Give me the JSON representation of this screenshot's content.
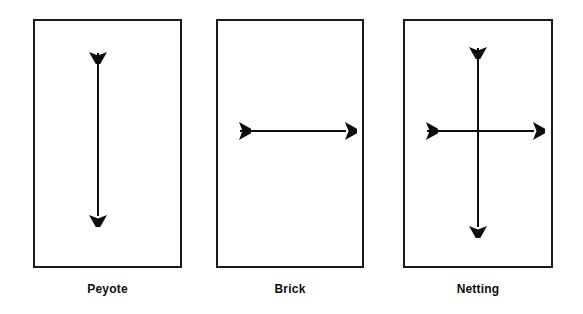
{
  "figure": {
    "title": "",
    "background_color": "#ffffff",
    "stroke_color": "#1a1a1a",
    "text_color": "#0d0d0d",
    "width": 583,
    "height": 314
  },
  "panels": [
    {
      "label": "Peyote",
      "arrow_directions": "vertical",
      "icon_name": "double-headed-vertical-arrow-icon",
      "box": {
        "x": 33,
        "y": 19,
        "w": 149,
        "h": 249
      },
      "label_pos": {
        "x": 33,
        "y": 282,
        "w": 149
      },
      "arrows": [
        {
          "name": "vertical-arrow",
          "x1": 98,
          "y1": 38,
          "x2": 98,
          "y2": 250
        }
      ]
    },
    {
      "label": "Brick",
      "arrow_directions": "horizontal",
      "icon_name": "double-headed-horizontal-arrow-icon",
      "box": {
        "x": 216,
        "y": 19,
        "w": 148,
        "h": 249
      },
      "label_pos": {
        "x": 216,
        "y": 282,
        "w": 148
      },
      "arrows": [
        {
          "name": "horizontal-arrow",
          "x1": 224,
          "y1": 131,
          "x2": 363,
          "y2": 131
        }
      ]
    },
    {
      "label": "Netting",
      "arrow_directions": "both",
      "icon_name": "double-headed-cross-arrow-icon",
      "box": {
        "x": 403,
        "y": 19,
        "w": 150,
        "h": 249
      },
      "label_pos": {
        "x": 403,
        "y": 282,
        "w": 150
      },
      "arrows": [
        {
          "name": "vertical-arrow",
          "x1": 478,
          "y1": 32,
          "x2": 478,
          "y2": 256
        },
        {
          "name": "horizontal-arrow",
          "x1": 411,
          "y1": 131,
          "x2": 550,
          "y2": 131
        }
      ]
    }
  ]
}
